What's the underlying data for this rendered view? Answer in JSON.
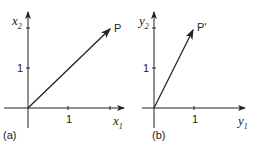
{
  "panels": [
    {
      "caption": "(a)",
      "x_axis": "x",
      "x_sub": "1",
      "y_axis": "x",
      "y_sub": "2",
      "x_tick": "1",
      "y_tick": "1",
      "point_label": "P",
      "point": [
        2,
        2
      ]
    },
    {
      "caption": "(b)",
      "x_axis": "y",
      "x_sub": "1",
      "y_axis": "y",
      "y_sub": "2",
      "x_tick": "1",
      "y_tick": "1",
      "point_label": "P'",
      "point": [
        1,
        2
      ]
    }
  ]
}
